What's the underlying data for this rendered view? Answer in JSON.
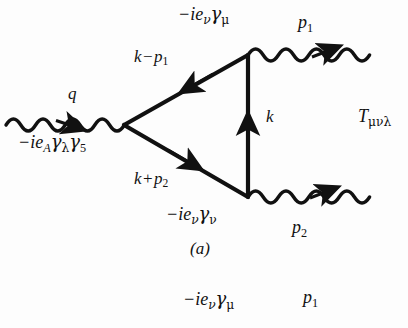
{
  "figure": {
    "type": "feynman-diagram",
    "caption": "(a)",
    "amplitude": {
      "symbol": "T",
      "indices": "μνλ",
      "full": "Tμνλ"
    },
    "vertices": [
      {
        "id": "axial-vertex",
        "position": "left",
        "coupling_label": "−ie A γλγ5",
        "prefix": "−ie",
        "charge_subscript": "A",
        "gamma1": "γ",
        "gamma1_index": "λ",
        "gamma2": "γ",
        "gamma2_index": "5"
      },
      {
        "id": "vector-vertex-mu",
        "position": "top-right",
        "coupling_label": "−ie ν γμ",
        "prefix": "−ie",
        "charge_subscript": "ν",
        "gamma1": "γ",
        "gamma1_index": "μ"
      },
      {
        "id": "vector-vertex-nu",
        "position": "bottom-right",
        "coupling_label": "−ie ν γν",
        "prefix": "−ie",
        "charge_subscript": "ν",
        "gamma1": "γ",
        "gamma1_index": "ν"
      }
    ],
    "momenta": [
      {
        "id": "q",
        "symbol": "q",
        "subscript": "",
        "line": "incoming-photon-left",
        "direction": "right"
      },
      {
        "id": "p1",
        "symbol": "p",
        "subscript": "1",
        "line": "outgoing-photon-top",
        "direction": "right"
      },
      {
        "id": "p2",
        "symbol": "p",
        "subscript": "2",
        "line": "outgoing-photon-bottom",
        "direction": "right"
      },
      {
        "id": "k",
        "symbol": "k",
        "subscript": "",
        "line": "internal-fermion-right",
        "direction": "up"
      },
      {
        "id": "k-minus-p1",
        "symbol": "k",
        "operator": "−",
        "second": "p",
        "second_subscript": "1",
        "line": "internal-fermion-upper",
        "direction": "down-left"
      },
      {
        "id": "k-plus-p2",
        "symbol": "k",
        "operator": "+",
        "second": "p",
        "second_subscript": "2",
        "line": "internal-fermion-lower",
        "direction": "down-right"
      }
    ],
    "next_figure_partial": {
      "coupling_label": "−ie ν γμ",
      "prefix": "−ie",
      "charge_subscript": "ν",
      "gamma1": "γ",
      "gamma1_index": "μ",
      "momentum_symbol": "p",
      "momentum_subscript": "1"
    },
    "colors": {
      "ink": "#111111",
      "background": "#fdfdfd"
    }
  }
}
